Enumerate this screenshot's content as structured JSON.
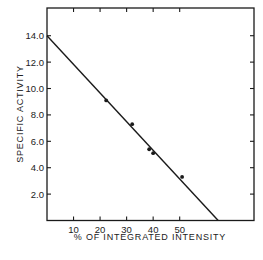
{
  "chart_data": {
    "type": "scatter",
    "title": "",
    "xlabel": "% OF INTEGRATED INTENSITY",
    "ylabel": "SPECIFIC ACTIVITY",
    "xlim": [
      0,
      78
    ],
    "ylim": [
      0,
      16.1
    ],
    "grid": false,
    "legend": null,
    "x_ticks": [
      10,
      20,
      30,
      40,
      50
    ],
    "x_tick_labels": [
      "10",
      "20",
      "30",
      "40",
      "50"
    ],
    "y_ticks": [
      2,
      4,
      6,
      8,
      10,
      12,
      14
    ],
    "y_tick_labels": [
      "2.0",
      "4.0",
      "6.0",
      "8.0",
      "10.0",
      "12.0",
      "14.0"
    ],
    "series": [
      {
        "name": "measured",
        "type": "scatter",
        "points": [
          {
            "x": 22.3,
            "y": 9.1
          },
          {
            "x": 32.1,
            "y": 7.3
          },
          {
            "x": 38.5,
            "y": 5.4
          },
          {
            "x": 40.0,
            "y": 5.1
          },
          {
            "x": 50.9,
            "y": 3.3
          }
        ]
      },
      {
        "name": "linear fit",
        "type": "line",
        "points": [
          {
            "x": 0,
            "y": 14.0
          },
          {
            "x": 64.5,
            "y": 0
          }
        ]
      }
    ]
  }
}
